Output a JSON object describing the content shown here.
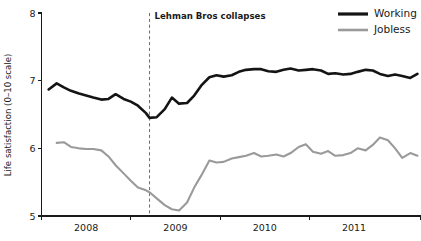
{
  "chart_data": {
    "type": "line",
    "title": "",
    "xlabel": "",
    "ylabel": "Life satisfaction (0–10 scale)",
    "ylim": [
      5,
      8
    ],
    "yticks": [
      5,
      6,
      7,
      8
    ],
    "ytick_labels": [
      "5",
      "6",
      "7",
      "8"
    ],
    "xlim": [
      2007.5,
      2011.75
    ],
    "xticks": [
      2007.5,
      2008.5,
      2009.5,
      2010.5,
      2011.75
    ],
    "xtick_labels": [
      "2008",
      "2009",
      "2010",
      "2011"
    ],
    "xtick_label_positions": [
      2008.0,
      2009.0,
      2010.0,
      2011.0
    ],
    "grid": false,
    "legend_position": "top-right",
    "annotations": [
      {
        "name": "lehman-collapse-marker",
        "text": "Lehman Bros collapses",
        "x": 2008.71,
        "style": "vertical-dashed-line"
      }
    ],
    "series": [
      {
        "name": "Working",
        "color": "#141414",
        "line_width": 2.6,
        "x": [
          2007.58,
          2007.67,
          2007.75,
          2007.83,
          2007.92,
          2008.0,
          2008.08,
          2008.17,
          2008.25,
          2008.33,
          2008.42,
          2008.5,
          2008.58,
          2008.67,
          2008.71,
          2008.79,
          2008.88,
          2008.96,
          2009.04,
          2009.13,
          2009.21,
          2009.29,
          2009.38,
          2009.46,
          2009.54,
          2009.63,
          2009.71,
          2009.79,
          2009.88,
          2009.96,
          2010.04,
          2010.13,
          2010.21,
          2010.29,
          2010.38,
          2010.46,
          2010.54,
          2010.63,
          2010.71,
          2010.79,
          2010.88,
          2010.96,
          2011.04,
          2011.13,
          2011.21,
          2011.29,
          2011.38,
          2011.46,
          2011.54,
          2011.63,
          2011.71
        ],
        "values": [
          6.87,
          6.96,
          6.9,
          6.85,
          6.81,
          6.78,
          6.75,
          6.72,
          6.73,
          6.8,
          6.73,
          6.69,
          6.63,
          6.52,
          6.45,
          6.46,
          6.58,
          6.75,
          6.66,
          6.67,
          6.78,
          6.93,
          7.05,
          7.08,
          7.06,
          7.08,
          7.13,
          7.16,
          7.17,
          7.17,
          7.14,
          7.13,
          7.16,
          7.18,
          7.15,
          7.16,
          7.17,
          7.15,
          7.1,
          7.11,
          7.09,
          7.1,
          7.13,
          7.16,
          7.15,
          7.1,
          7.07,
          7.09,
          7.07,
          7.04,
          7.1
        ]
      },
      {
        "name": "Jobless",
        "color": "#9a9a9a",
        "line_width": 2.1,
        "x": [
          2007.67,
          2007.75,
          2007.83,
          2007.92,
          2008.0,
          2008.08,
          2008.17,
          2008.25,
          2008.33,
          2008.42,
          2008.5,
          2008.58,
          2008.67,
          2008.71,
          2008.79,
          2008.88,
          2008.96,
          2009.04,
          2009.13,
          2009.21,
          2009.29,
          2009.38,
          2009.46,
          2009.54,
          2009.63,
          2009.71,
          2009.79,
          2009.88,
          2009.96,
          2010.04,
          2010.13,
          2010.21,
          2010.29,
          2010.38,
          2010.46,
          2010.54,
          2010.63,
          2010.71,
          2010.79,
          2010.88,
          2010.96,
          2011.04,
          2011.13,
          2011.21,
          2011.29,
          2011.38,
          2011.46,
          2011.54,
          2011.63,
          2011.71
        ],
        "values": [
          6.08,
          6.09,
          6.02,
          6.0,
          5.99,
          5.99,
          5.97,
          5.88,
          5.75,
          5.63,
          5.52,
          5.42,
          5.38,
          5.35,
          5.26,
          5.16,
          5.1,
          5.08,
          5.2,
          5.42,
          5.6,
          5.82,
          5.79,
          5.8,
          5.85,
          5.87,
          5.89,
          5.93,
          5.88,
          5.89,
          5.91,
          5.88,
          5.93,
          6.02,
          6.06,
          5.95,
          5.92,
          5.96,
          5.89,
          5.9,
          5.93,
          6.0,
          5.97,
          6.05,
          6.16,
          6.12,
          6.0,
          5.86,
          5.93,
          5.89
        ]
      }
    ],
    "legend": [
      {
        "label": "Working",
        "color": "#141414",
        "line_width": 3.2
      },
      {
        "label": "Jobless",
        "color": "#9a9a9a",
        "line_width": 2.6
      }
    ]
  }
}
